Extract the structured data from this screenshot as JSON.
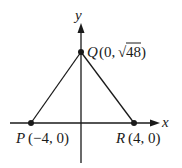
{
  "diagram": {
    "type": "coordinate-triangle",
    "axes": {
      "x_label": "x",
      "y_label": "y"
    },
    "points": [
      {
        "name": "P",
        "coords": "(−4, 0)",
        "x": -4,
        "y": 0
      },
      {
        "name": "Q",
        "coords_prefix": "(0, ",
        "coords_radical": "√",
        "coords_radicand": "48",
        "coords_suffix": ")",
        "x": 0,
        "y": "sqrt(48)"
      },
      {
        "name": "R",
        "coords": "(4, 0)",
        "x": 4,
        "y": 0
      }
    ],
    "edges": [
      [
        "P",
        "Q"
      ],
      [
        "Q",
        "R"
      ]
    ],
    "colors": {
      "ink": "#1a1a1a",
      "background": "#ffffff"
    }
  }
}
